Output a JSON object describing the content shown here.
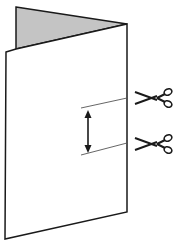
{
  "diagram": {
    "colors": {
      "stroke": "#1a1a1a",
      "fold_fill": "#c4c4c4",
      "panel_fill": "#ffffff",
      "background": "#ffffff"
    },
    "back_fold": {
      "points": "16,7 127,24 16,49"
    },
    "front_panel": {
      "points": "6,52 127,24 127,212 5,239"
    },
    "cut_lines": [
      {
        "x1": 81,
        "y1": 108,
        "x2": 127,
        "y2": 98
      },
      {
        "x1": 81,
        "y1": 155,
        "x2": 127,
        "y2": 143
      }
    ],
    "arrow": {
      "x": 88,
      "y1": 111,
      "y2": 152
    },
    "scissors": [
      {
        "name": "scissors-top-icon",
        "x": 135,
        "y": 87
      },
      {
        "name": "scissors-bottom-icon",
        "x": 135,
        "y": 133
      }
    ]
  }
}
